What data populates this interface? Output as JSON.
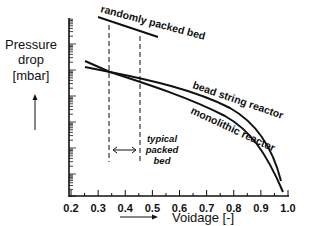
{
  "chart_data": {
    "type": "line",
    "title": "",
    "xlabel": "Voidage [-]",
    "ylabel": "Pressure drop [mbar]",
    "x_ticks": [
      "0.2",
      "0.3",
      "0.4",
      "0.5",
      "0.6",
      "0.7",
      "0.8",
      "0.9",
      "1.0"
    ],
    "xlim": [
      0.2,
      1.0
    ],
    "y_scale": "log (unlabeled)",
    "series": [
      {
        "name": "randomly packed bed",
        "x": [
          0.33,
          0.5
        ],
        "y_rel": [
          0.97,
          0.86
        ]
      },
      {
        "name": "bead string reactor",
        "x": [
          0.25,
          0.34,
          0.45,
          0.6,
          0.75,
          0.9,
          0.97
        ],
        "y_rel": [
          0.72,
          0.66,
          0.61,
          0.53,
          0.43,
          0.28,
          0.1
        ]
      },
      {
        "name": "monolithic reactor",
        "x": [
          0.25,
          0.34,
          0.45,
          0.6,
          0.75,
          0.9,
          0.96
        ],
        "y_rel": [
          0.68,
          0.66,
          0.58,
          0.48,
          0.37,
          0.21,
          0.04
        ]
      }
    ],
    "annotations": [
      {
        "text": "typical packed bed",
        "x_range": [
          0.34,
          0.45
        ]
      }
    ],
    "grid": false,
    "legend": "inline labels"
  },
  "labels": {
    "y_line1": "Pressure",
    "y_line2": "drop",
    "y_line3": "[mbar]",
    "x_axis": "Voidage [-]",
    "random": "randomly packed bed",
    "bead": "bead string reactor",
    "mono": "monolithic reactor",
    "typ1": "typical",
    "typ2": "packed",
    "typ3": "bed"
  }
}
